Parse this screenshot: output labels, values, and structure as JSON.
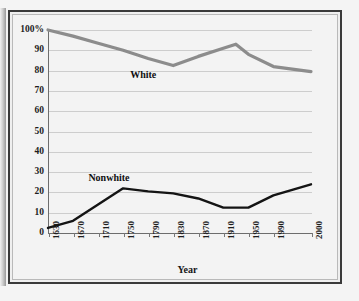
{
  "figure": {
    "axis_title_x": "Year",
    "label_white": "White",
    "label_nonwhite": "Nonwhite",
    "color_white": "#8c8c8c",
    "color_nonwhite": "#141414",
    "background": "#f3f3f3",
    "gridline_color": "#cdcdcd",
    "axis_color": "#6d6d6d"
  },
  "chart_data": {
    "type": "line",
    "title": "",
    "subtitle": "",
    "xlabel": "Year",
    "ylabel": "",
    "grid": true,
    "legend": "inline-labels",
    "xlim": [
      1630,
      2000
    ],
    "ylim": [
      0,
      100
    ],
    "ytick_labels": [
      "100%",
      "90",
      "80",
      "70",
      "60",
      "50",
      "40",
      "30",
      "20",
      "10",
      "0"
    ],
    "ytick_values": [
      100,
      90,
      80,
      70,
      60,
      50,
      40,
      30,
      20,
      10,
      0
    ],
    "xtick_labels": [
      "1630",
      "1670",
      "1710",
      "1750",
      "1790",
      "1830",
      "1870",
      "1910",
      "1950",
      "1990",
      "2000"
    ],
    "xtick_values": [
      1630,
      1670,
      1710,
      1750,
      1790,
      1830,
      1870,
      1910,
      1950,
      1990,
      2000
    ],
    "x": [
      1630,
      1670,
      1710,
      1750,
      1790,
      1830,
      1870,
      1910,
      1930,
      1950,
      1990,
      2000
    ],
    "series": [
      {
        "name": "White",
        "color": "#8c8c8c",
        "values": [
          100,
          97,
          93.5,
          90,
          86,
          82.5,
          87,
          91,
          93,
          88,
          82,
          79.5
        ]
      },
      {
        "name": "Nonwhite",
        "color": "#141414",
        "values": [
          2.5,
          6,
          14,
          22,
          20.5,
          19.5,
          17,
          12.5,
          12.5,
          12.5,
          18.5,
          24
        ]
      }
    ],
    "annotations": [
      {
        "text": "White",
        "x": 1790,
        "y": 78
      },
      {
        "text": "Nonwhite",
        "x": 1736,
        "y": 27
      }
    ]
  }
}
